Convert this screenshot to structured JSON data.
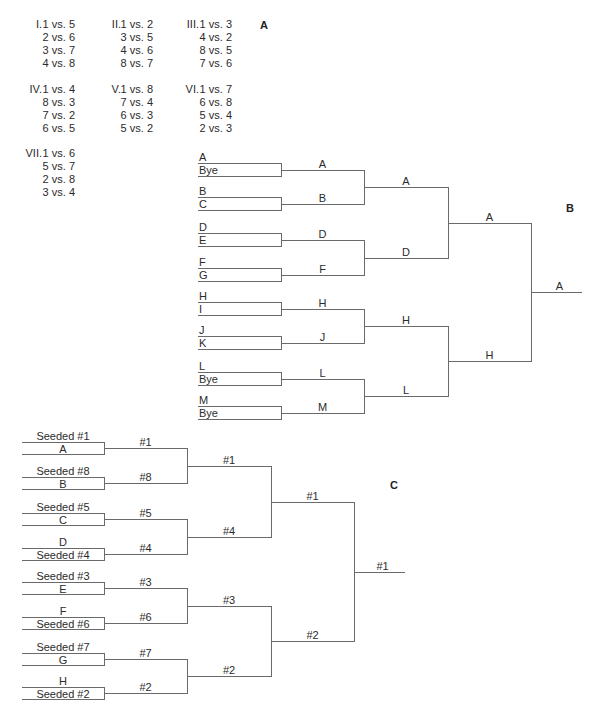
{
  "panel_labels": {
    "a": "A",
    "b": "B",
    "c": "C"
  },
  "schedule": {
    "groups": [
      {
        "round": "I.",
        "matches": [
          "1 vs. 5",
          "2 vs. 6",
          "3 vs. 7",
          "4 vs. 8"
        ]
      },
      {
        "round": "II.",
        "matches": [
          "1 vs. 2",
          "3 vs. 5",
          "4 vs. 6",
          "8 vs. 7"
        ]
      },
      {
        "round": "III.",
        "matches": [
          "1 vs. 3",
          "4 vs. 2",
          "8 vs. 5",
          "7 vs. 6"
        ]
      },
      {
        "round": "IV.",
        "matches": [
          "1 vs. 4",
          "8 vs. 3",
          "7 vs. 2",
          "6 vs. 5"
        ]
      },
      {
        "round": "V.",
        "matches": [
          "1 vs. 8",
          "7 vs. 4",
          "6 vs. 3",
          "5 vs. 2"
        ]
      },
      {
        "round": "VI.",
        "matches": [
          "1 vs. 7",
          "6 vs. 8",
          "5 vs. 4",
          "2 vs. 3"
        ]
      },
      {
        "round": "VII.",
        "matches": [
          "1 vs. 6",
          "5 vs. 7",
          "2 vs. 8",
          "3 vs. 4"
        ]
      }
    ]
  },
  "bracket_b": {
    "first_round": [
      {
        "top": "A",
        "bottom": "Bye"
      },
      {
        "top": "B",
        "bottom": "C"
      },
      {
        "top": "D",
        "bottom": "E"
      },
      {
        "top": "F",
        "bottom": "G"
      },
      {
        "top": "H",
        "bottom": "I"
      },
      {
        "top": "J",
        "bottom": "K"
      },
      {
        "top": "L",
        "bottom": "Bye"
      },
      {
        "top": "M",
        "bottom": "Bye"
      }
    ],
    "round2_winners": [
      "A",
      "B",
      "D",
      "F",
      "H",
      "J",
      "L",
      "M"
    ],
    "round3_winners": [
      "A",
      "D",
      "H",
      "L"
    ],
    "round4_winners": [
      "A",
      "H"
    ],
    "champion": "A"
  },
  "bracket_c": {
    "first_round": [
      {
        "top": "Seeded #1",
        "bottom": "A"
      },
      {
        "top": "Seeded #8",
        "bottom": "B"
      },
      {
        "top": "Seeded #5",
        "bottom": "C"
      },
      {
        "top": "D",
        "bottom": "Seeded #4"
      },
      {
        "top": "Seeded #3",
        "bottom": "E"
      },
      {
        "top": "F",
        "bottom": "Seeded #6"
      },
      {
        "top": "Seeded #7",
        "bottom": "G"
      },
      {
        "top": "H",
        "bottom": "Seeded #2"
      }
    ],
    "round2_winners": [
      "#1",
      "#8",
      "#5",
      "#4",
      "#3",
      "#6",
      "#7",
      "#2"
    ],
    "round3_winners": [
      "#1",
      "#4",
      "#3",
      "#2"
    ],
    "round4_winners": [
      "#1",
      "#2"
    ],
    "champion": "#1"
  }
}
